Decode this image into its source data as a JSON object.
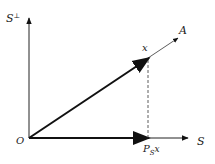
{
  "diagram": {
    "type": "vector-projection",
    "labels": {
      "s_perp": "S",
      "s_perp_sup": "⊥",
      "a": "A",
      "x": "x",
      "origin": "O",
      "s": "S",
      "proj_main": "P",
      "proj_sub": "S",
      "proj_arg": "x"
    },
    "colors": {
      "stroke": "#111111",
      "background": "#ffffff"
    }
  }
}
